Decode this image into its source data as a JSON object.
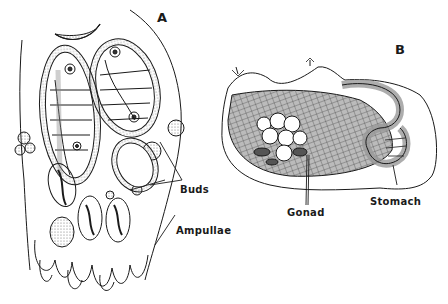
{
  "figure": {
    "panels": [
      {
        "id": "A",
        "label": "A"
      },
      {
        "id": "B",
        "label": "B"
      }
    ],
    "annotations": {
      "buds": "Buds",
      "ampullae": "Ampullae",
      "gonad": "Gonad",
      "stomach": "Stomach"
    },
    "colors": {
      "ink": "#1a1a1a",
      "background": "#ffffff",
      "stipple": "#8a8a8a"
    }
  }
}
